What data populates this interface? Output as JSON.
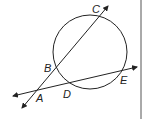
{
  "figure": {
    "type": "geometry-circle-secant-lines",
    "points": {
      "A": "A",
      "B": "B",
      "C": "C",
      "D": "D",
      "E": "E"
    }
  },
  "colors": {
    "stroke": "#222222",
    "background": "#ffffff",
    "border": "#555555"
  }
}
